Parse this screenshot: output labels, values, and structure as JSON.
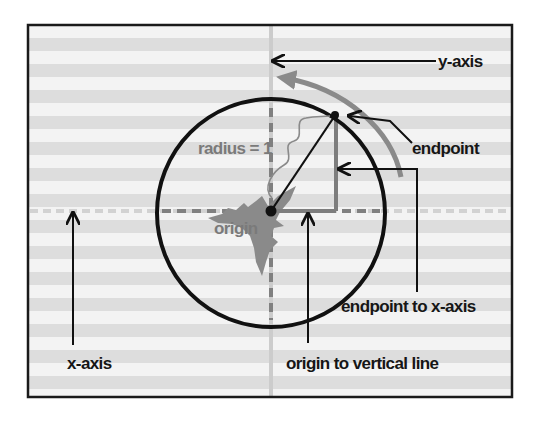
{
  "diagram": {
    "colors": {
      "frame": "#1a1a1a",
      "stripe_light": "#f3f3f3",
      "stripe_dark": "#dddddd",
      "ink": "#111111",
      "gray_ink": "#7d7d7d",
      "light_axis": "#cfcfcf",
      "splash": "#8c8c8c"
    },
    "labels": {
      "y_axis": "y-axis",
      "x_axis": "x-axis",
      "endpoint": "endpoint",
      "radius": "radius = 1",
      "origin": "origin",
      "endpoint_to_x_axis": "endpoint to x-axis",
      "origin_to_vertical_line": "origin to vertical line"
    },
    "unit_circle": {
      "radius_value": 1,
      "endpoint_angle_degrees": 55
    }
  }
}
